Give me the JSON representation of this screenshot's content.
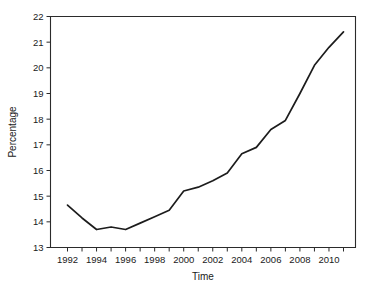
{
  "chart_data": {
    "type": "line",
    "title": "",
    "xlabel": "Time",
    "ylabel": "Percentage",
    "xlim": [
      1991.3,
      1991.3
    ],
    "ylim": [
      13,
      22
    ],
    "grid": false,
    "legend": "none",
    "x": [
      1992,
      1993,
      1994,
      1995,
      1996,
      1997,
      1998,
      1999,
      2000,
      2001,
      2002,
      2003,
      2004,
      2005,
      2006,
      2007,
      2008,
      2009,
      2010,
      2011
    ],
    "values": [
      14.65,
      14.15,
      13.7,
      13.8,
      13.7,
      13.95,
      14.2,
      14.45,
      15.2,
      15.35,
      15.6,
      15.9,
      16.65,
      16.9,
      17.6,
      17.95,
      19.0,
      20.1,
      20.8,
      21.4
    ],
    "series": [
      {
        "name": "Percentage",
        "values": [
          14.65,
          14.15,
          13.7,
          13.8,
          13.7,
          13.95,
          14.2,
          14.45,
          15.2,
          15.35,
          15.6,
          15.9,
          16.65,
          16.9,
          17.6,
          17.95,
          19.0,
          20.1,
          20.8,
          21.4
        ],
        "color": "#1c1c1c"
      }
    ],
    "y_ticks": [
      13,
      14,
      15,
      16,
      17,
      18,
      19,
      20,
      21,
      22
    ],
    "y_tick_labels": [
      "13",
      "14",
      "15",
      "16",
      "17",
      "18",
      "19",
      "20",
      "21",
      "22"
    ],
    "x_ticks": [
      1992,
      1993,
      1994,
      1995,
      1996,
      1997,
      1998,
      1999,
      2000,
      2001,
      2002,
      2003,
      2004,
      2005,
      2006,
      2007,
      2008,
      2009,
      2010,
      2011
    ],
    "x_tick_labels": [
      "1992",
      "",
      "1994",
      "",
      "1996",
      "",
      "1998",
      "",
      "2000",
      "",
      "2002",
      "",
      "2004",
      "",
      "2006",
      "",
      "2008",
      "",
      "2010",
      ""
    ],
    "axis_color": "#2b2b2b",
    "background_color": "#ffffff"
  }
}
